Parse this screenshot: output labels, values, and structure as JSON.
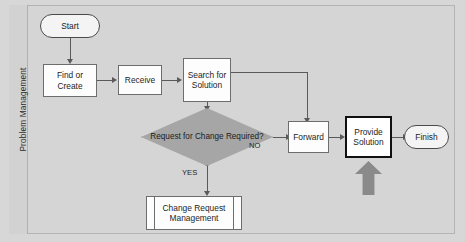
{
  "diagram": {
    "lane_label": "Problem Management",
    "nodes": {
      "start": "Start",
      "find_or_create": "Find or Create",
      "receive": "Receive",
      "search_for_solution": "Search for Solution",
      "decision": "Request for Change Required?",
      "forward": "Forward",
      "provide_solution": "Provide Solution",
      "finish": "Finish",
      "change_request_management": "Change Request Management"
    },
    "edge_labels": {
      "no": "NO",
      "yes": "YES"
    },
    "colors": {
      "canvas": "#d7d7d7",
      "lane": "#d5d5d5",
      "process_fill": "#fdfdfd",
      "decision_fill": "#a6a6a6",
      "connector": "#5a5a5a",
      "emphasis_border": "#101010",
      "block_arrow": "#8a8a8a"
    }
  }
}
